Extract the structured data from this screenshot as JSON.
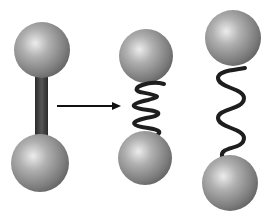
{
  "diagram": {
    "colors": {
      "sphere_light": "#e4e4e4",
      "sphere_dark": "#5a5a5a",
      "rod": "#3a3a3a",
      "spring": "#1e1e1e",
      "arrow": "#111111"
    },
    "elements": [
      {
        "id": "rigid-dumbbell",
        "label": "rigid rod"
      },
      {
        "id": "arrow",
        "label": "transition arrow"
      },
      {
        "id": "compressed-spring",
        "label": "compressed spring"
      },
      {
        "id": "stretched-spring",
        "label": "stretched spring"
      }
    ]
  }
}
